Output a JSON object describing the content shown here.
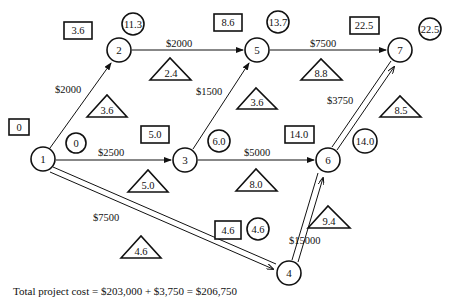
{
  "diagram": {
    "nodes": [
      {
        "id": "1",
        "x": 43,
        "y": 159,
        "box": "0",
        "circle": "0"
      },
      {
        "id": "2",
        "x": 119,
        "y": 50,
        "box": "3.6",
        "circle": "11.3"
      },
      {
        "id": "3",
        "x": 185,
        "y": 160,
        "box": "5.0",
        "circle": "6.0"
      },
      {
        "id": "4",
        "x": 289,
        "y": 273,
        "box": "4.6",
        "circle": "4.6"
      },
      {
        "id": "5",
        "x": 257,
        "y": 50,
        "box": "8.6",
        "circle": "13.7"
      },
      {
        "id": "6",
        "x": 328,
        "y": 160,
        "box": "14.0",
        "circle": "14.0"
      },
      {
        "id": "7",
        "x": 400,
        "y": 50,
        "box": "22.5",
        "circle": "22.5"
      }
    ],
    "edges": [
      {
        "from": "1",
        "to": "2",
        "cost": "$2000",
        "triangle": "3.6",
        "double": false
      },
      {
        "from": "1",
        "to": "3",
        "cost": "$2500",
        "triangle": "5.0",
        "double": false
      },
      {
        "from": "1",
        "to": "4",
        "cost": "$7500",
        "triangle": "4.6",
        "double": true
      },
      {
        "from": "2",
        "to": "5",
        "cost": "$2000",
        "triangle": "2.4",
        "double": false
      },
      {
        "from": "3",
        "to": "5",
        "cost": "$1500",
        "triangle": "3.6",
        "double": false
      },
      {
        "from": "3",
        "to": "6",
        "cost": "$5000",
        "triangle": "8.0",
        "double": false
      },
      {
        "from": "4",
        "to": "6",
        "cost": "$15000",
        "triangle": "9.4",
        "double": true
      },
      {
        "from": "5",
        "to": "7",
        "cost": "$7500",
        "triangle": "8.8",
        "double": false
      },
      {
        "from": "6",
        "to": "7",
        "cost": "$3750",
        "triangle": "8.5",
        "double": true
      }
    ]
  },
  "labels": {
    "n1": "1",
    "n2": "2",
    "n3": "3",
    "n4": "4",
    "n5": "5",
    "n6": "6",
    "n7": "7",
    "box1": "0",
    "box2": "3.6",
    "box3": "5.0",
    "box4": "4.6",
    "box5": "8.6",
    "box6": "14.0",
    "box7": "22.5",
    "circ1": "0",
    "circ2": "11.3",
    "circ3": "6.0",
    "circ4": "4.6",
    "circ5": "13.7",
    "circ6": "14.0",
    "circ7": "22.5",
    "cost12": "$2000",
    "cost13": "$2500",
    "cost14": "$7500",
    "cost25": "$2000",
    "cost35": "$1500",
    "cost36": "$5000",
    "cost46": "$15000",
    "cost57": "$7500",
    "cost67": "$3750",
    "tri12": "3.6",
    "tri13": "5.0",
    "tri14": "4.6",
    "tri25": "2.4",
    "tri35": "3.6",
    "tri36": "8.0",
    "tri46": "9.4",
    "tri57": "8.8",
    "tri67": "8.5"
  },
  "footer": {
    "total_cost": "Total project cost  =  $203,000  + $3,750 =  $206,750"
  }
}
